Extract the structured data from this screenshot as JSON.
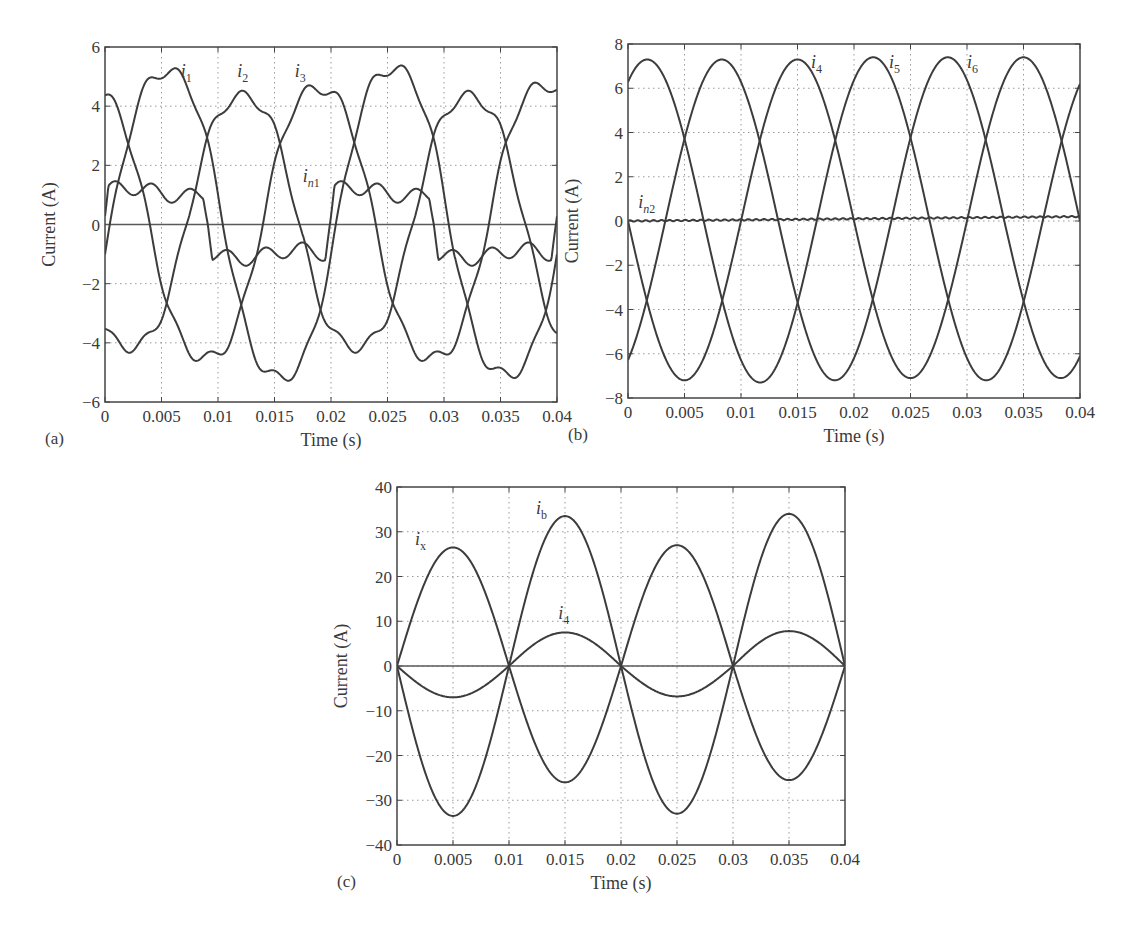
{
  "figure": {
    "panels": [
      {
        "id": "a",
        "caption": "(a)"
      },
      {
        "id": "b",
        "caption": "(b)"
      },
      {
        "id": "c",
        "caption": "(c)"
      }
    ]
  },
  "colors": {
    "line": "#3c3c3c",
    "grid": "#9a9a9a",
    "axis": "#444444",
    "text": "#3a3a3a"
  },
  "chart_data": [
    {
      "id": "a",
      "type": "line",
      "panel_label": "(a)",
      "title": "",
      "xlabel": "Time (s)",
      "ylabel": "Current (A)",
      "xlim": [
        0,
        0.04
      ],
      "ylim": [
        -6,
        6
      ],
      "xticks": [
        0,
        0.005,
        0.01,
        0.015,
        0.02,
        0.025,
        0.03,
        0.035,
        0.04
      ],
      "xtick_labels": [
        "0",
        "0.005",
        "0.01",
        "0.015",
        "0.02",
        "0.025",
        "0.03",
        "0.035",
        "0.04"
      ],
      "yticks": [
        -6,
        -4,
        -2,
        0,
        2,
        4,
        6
      ],
      "ytick_labels": [
        "−6",
        "−4",
        "−2",
        "0",
        "2",
        "4",
        "6"
      ],
      "grid": true,
      "box": {
        "left": 105,
        "top": 47,
        "right": 557,
        "bottom": 402
      },
      "series": [
        {
          "name": "i1",
          "label_main": "i",
          "label_sub": "1",
          "label_pos": [
            0.0067,
            5.0
          ],
          "model": "sine",
          "amplitude": 5.0,
          "period": 0.02,
          "peak_time": 0.0055,
          "offset": 0.0,
          "ripple": 0.25,
          "peaks": [
            {
              "t": 0.006,
              "v": 5.5
            },
            {
              "t": 0.016,
              "v": -5.5
            },
            {
              "t": 0.026,
              "v": 5.6
            },
            {
              "t": 0.036,
              "v": -5.4
            }
          ]
        },
        {
          "name": "i2",
          "label_main": "i",
          "label_sub": "2",
          "label_pos": [
            0.0117,
            5.0
          ],
          "model": "sine",
          "amplitude": 4.6,
          "period": 0.02,
          "peak_time": 0.0122,
          "offset": 0.0,
          "ripple": 0.25,
          "peaks": [
            {
              "t": 0.0025,
              "v": -4.4
            },
            {
              "t": 0.0125,
              "v": 4.6
            },
            {
              "t": 0.0225,
              "v": -4.4
            },
            {
              "t": 0.0325,
              "v": 4.6
            }
          ]
        },
        {
          "name": "i3",
          "label_main": "i",
          "label_sub": "3",
          "label_pos": [
            0.0168,
            5.0
          ],
          "model": "sine",
          "amplitude": 4.9,
          "period": 0.02,
          "peak_time": 0.0189,
          "offset": 0.0,
          "ripple": 0.25,
          "peaks": [
            {
              "t": 0.0095,
              "v": -4.8
            },
            {
              "t": 0.019,
              "v": 4.9
            },
            {
              "t": 0.029,
              "v": -4.8
            },
            {
              "t": 0.039,
              "v": 5.0
            }
          ]
        },
        {
          "name": "in1",
          "label_main": "i",
          "label_sub": "n1",
          "label_pos": [
            0.0175,
            1.45
          ],
          "model": "square",
          "amplitude": 1.05,
          "period": 0.02,
          "rise_time": 0.0195,
          "offset": 0.0,
          "ripple": 0.25,
          "levels": {
            "high": 1.1,
            "low": -1.0
          }
        }
      ],
      "zero_line": true
    },
    {
      "id": "b",
      "type": "line",
      "panel_label": "(b)",
      "title": "",
      "xlabel": "Time (s)",
      "ylabel": "Current (A)",
      "xlim": [
        0,
        0.04
      ],
      "ylim": [
        -8,
        8
      ],
      "xticks": [
        0,
        0.005,
        0.01,
        0.015,
        0.02,
        0.025,
        0.03,
        0.035,
        0.04
      ],
      "xtick_labels": [
        "0",
        "0.005",
        "0.01",
        "0.015",
        "0.02",
        "0.025",
        "0.03",
        "0.035",
        "0.04"
      ],
      "yticks": [
        -8,
        -6,
        -4,
        -2,
        0,
        2,
        4,
        6,
        8
      ],
      "ytick_labels": [
        "−8",
        "−6",
        "−4",
        "−2",
        "0",
        "2",
        "4",
        "6",
        "8"
      ],
      "grid": true,
      "box": {
        "left": 628,
        "top": 44,
        "right": 1080,
        "bottom": 398
      },
      "series": [
        {
          "name": "i4",
          "label_main": "i",
          "label_sub": "4",
          "label_pos": [
            0.0162,
            6.9
          ],
          "model": "sine",
          "amplitude": 7.3,
          "period": 0.02,
          "peak_time": 0.015,
          "offset": 0.0,
          "ripple": 0.0,
          "peaks": [
            {
              "t": 0.005,
              "v": -7.2
            },
            {
              "t": 0.015,
              "v": 7.3
            },
            {
              "t": 0.025,
              "v": -7.1
            },
            {
              "t": 0.035,
              "v": 7.4
            }
          ]
        },
        {
          "name": "i5",
          "label_main": "i",
          "label_sub": "5",
          "label_pos": [
            0.0231,
            6.9
          ],
          "model": "sine",
          "amplitude": 7.3,
          "period": 0.02,
          "peak_time": 0.0017,
          "offset": 0.0,
          "ripple": 0.0,
          "peaks": [
            {
              "t": 0.0017,
              "v": 7.3
            },
            {
              "t": 0.0117,
              "v": -7.3
            },
            {
              "t": 0.0217,
              "v": 7.4
            },
            {
              "t": 0.0317,
              "v": -7.2
            }
          ]
        },
        {
          "name": "i6",
          "label_main": "i",
          "label_sub": "6",
          "label_pos": [
            0.03,
            6.9
          ],
          "model": "sine",
          "amplitude": 7.3,
          "period": 0.02,
          "peak_time": 0.0083,
          "offset": 0.0,
          "ripple": 0.0,
          "peaks": [
            {
              "t": 0.0083,
              "v": 7.3
            },
            {
              "t": 0.0183,
              "v": -7.2
            },
            {
              "t": 0.0283,
              "v": 7.4
            },
            {
              "t": 0.0383,
              "v": -7.1
            }
          ]
        },
        {
          "name": "in2",
          "label_main": "i",
          "label_sub": "n2",
          "label_pos": [
            0.0009,
            0.6
          ],
          "model": "flat",
          "value_start": 0.0,
          "value_end": 0.2,
          "offset": 0.0,
          "ripple": 0.03
        }
      ],
      "zero_line": false
    },
    {
      "id": "c",
      "type": "line",
      "panel_label": "(c)",
      "title": "",
      "xlabel": "Time (s)",
      "ylabel": "Current (A)",
      "xlim": [
        0,
        0.04
      ],
      "ylim": [
        -40,
        40
      ],
      "xticks": [
        0,
        0.005,
        0.01,
        0.015,
        0.02,
        0.025,
        0.03,
        0.035,
        0.04
      ],
      "xtick_labels": [
        "0",
        "0.005",
        "0.01",
        "0.015",
        "0.02",
        "0.025",
        "0.03",
        "0.035",
        "0.04"
      ],
      "yticks": [
        -40,
        -30,
        -20,
        -10,
        0,
        10,
        20,
        30,
        40
      ],
      "ytick_labels": [
        "−40",
        "−30",
        "−20",
        "−10",
        "0",
        "10",
        "20",
        "30",
        "40"
      ],
      "grid": true,
      "box": {
        "left": 397,
        "top": 487,
        "right": 845,
        "bottom": 845
      },
      "series": [
        {
          "name": "ix",
          "label_main": "i",
          "label_sub": "x",
          "label_pos": [
            0.0016,
            27.0
          ],
          "model": "sine",
          "amplitude": 26.5,
          "period": 0.02,
          "peak_time": 0.005,
          "offset": 0.0,
          "ripple": 0.0,
          "peaks": [
            {
              "t": 0.005,
              "v": 26.5
            },
            {
              "t": 0.015,
              "v": -26.0
            },
            {
              "t": 0.025,
              "v": 27.0
            },
            {
              "t": 0.035,
              "v": -25.5
            }
          ]
        },
        {
          "name": "ib",
          "label_main": "i",
          "label_sub": "b",
          "label_pos": [
            0.0124,
            34.0
          ],
          "model": "sine",
          "amplitude": 33.7,
          "period": 0.02,
          "peak_time": 0.015,
          "offset": 0.0,
          "ripple": 0.0,
          "peaks": [
            {
              "t": 0.005,
              "v": -33.5
            },
            {
              "t": 0.015,
              "v": 33.5
            },
            {
              "t": 0.025,
              "v": -33.0
            },
            {
              "t": 0.035,
              "v": 34.0
            }
          ]
        },
        {
          "name": "i4",
          "label_main": "i",
          "label_sub": "4",
          "label_pos": [
            0.0144,
            10.5
          ],
          "model": "sine",
          "amplitude": 7.3,
          "period": 0.02,
          "peak_time": 0.015,
          "offset": 0.0,
          "ripple": 0.0,
          "peaks": [
            {
              "t": 0.005,
              "v": -7.0
            },
            {
              "t": 0.015,
              "v": 7.5
            },
            {
              "t": 0.025,
              "v": -6.8
            },
            {
              "t": 0.035,
              "v": 7.8
            }
          ]
        }
      ],
      "zero_line": true
    }
  ]
}
